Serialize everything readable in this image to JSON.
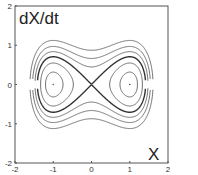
{
  "chart_data": {
    "type": "line",
    "title": "",
    "xlabel": "X",
    "ylabel": "dX/dt",
    "xlim": [
      -2,
      2
    ],
    "ylim": [
      -2,
      2
    ],
    "xticks": [
      "-2",
      "-1",
      "0",
      "1",
      "2"
    ],
    "yticks": [
      "2",
      "1",
      "0",
      "-1",
      "-2"
    ],
    "grid": false,
    "energy_levels": {
      "inner_loops": [
        -0.2,
        -0.1
      ],
      "separatrix": 0,
      "outer_curves": [
        0.1,
        0.22,
        0.38
      ]
    },
    "fixed_points": [
      [
        -1,
        0
      ],
      [
        1,
        0
      ],
      [
        0,
        0
      ]
    ]
  }
}
